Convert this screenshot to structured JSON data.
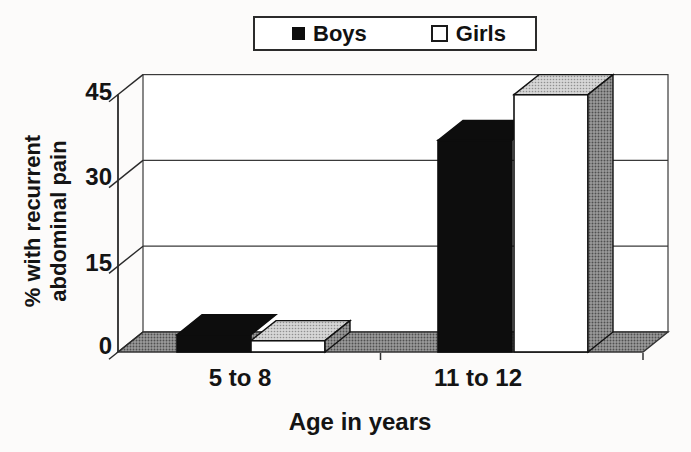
{
  "chart_data": {
    "type": "bar",
    "style": "3d-perspective-columns",
    "categories": [
      "5 to 8",
      "11 to 12"
    ],
    "series": [
      {
        "name": "Boys",
        "swatch": "black-filled-square",
        "values": [
          3,
          37
        ]
      },
      {
        "name": "Girls",
        "swatch": "white-outlined-square",
        "values": [
          2,
          45
        ]
      }
    ],
    "title": "",
    "xlabel": "Age in years",
    "ylabel": "% with recurrent abdominal pain",
    "yticks": [
      0,
      15,
      30,
      45
    ],
    "ylim": [
      0,
      45
    ],
    "grid": true,
    "legend_position": "top-center"
  },
  "legend": {
    "items": [
      {
        "label": "Boys"
      },
      {
        "label": "Girls"
      }
    ]
  },
  "axes": {
    "y_title_line1": "% with recurrent",
    "y_title_line2": "abdominal pain",
    "x_title": "Age in years",
    "y_tick_labels": [
      "45",
      "30",
      "15",
      "0"
    ],
    "x_tick_labels": [
      "5 to 8",
      "11 to 12"
    ]
  },
  "colors": {
    "boys_fill": "#0d0d0d",
    "girls_fill": "#ffffff",
    "outline": "#111111",
    "wall_line": "#3a3a3a",
    "floor_halftone_gray": "#8f8f8f",
    "top_face_gray": "#bdbdbd",
    "text": "#141414",
    "background": "#fcfbfa"
  }
}
